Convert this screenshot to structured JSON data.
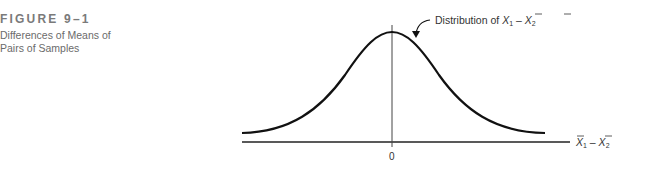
{
  "caption": {
    "label": "FIGURE 9–1",
    "title": "Differences of Means of Pairs of Samples"
  },
  "diagram": {
    "type": "normal-distribution-curve",
    "annotation": {
      "prefix": "Distribution of ",
      "x1": "X",
      "sub1": "1",
      "minus": " – ",
      "x2": "X",
      "sub2": "2"
    },
    "axis": {
      "zero_label": "0",
      "label_x1": "X",
      "label_sub1": "1",
      "label_minus": " – ",
      "label_x2": "X",
      "label_sub2": "2"
    },
    "colors": {
      "curve": "#111111",
      "axis": "#222222",
      "text": "#333333"
    }
  }
}
